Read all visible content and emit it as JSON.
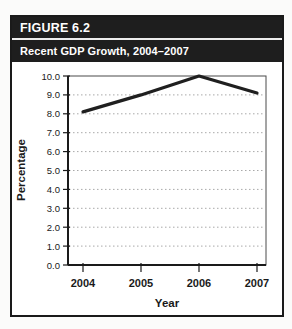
{
  "header": {
    "figure_label": "FIGURE 6.2",
    "title": "Recent GDP Growth, 2004–2007"
  },
  "chart_data": {
    "type": "line",
    "categories": [
      "2004",
      "2005",
      "2006",
      "2007"
    ],
    "values": [
      8.1,
      9.0,
      10.0,
      9.1
    ],
    "title": "Recent GDP Growth, 2004–2007",
    "xlabel": "Year",
    "ylabel": "Percentage",
    "ylim": [
      0,
      10
    ],
    "ytick_step": 1,
    "ytick_decimals": 1,
    "grid": "horizontal-dotted",
    "legend": "none"
  },
  "colors": {
    "header_bg": "#1e1e1e",
    "header_text": "#ffffff",
    "figure_border": "#1a1a1a",
    "plot_border": "#4a4a4a",
    "axis": "#1a1a1a",
    "grid": "#a9a9a9",
    "line": "#1f1f1f",
    "background": "#ffffff"
  }
}
